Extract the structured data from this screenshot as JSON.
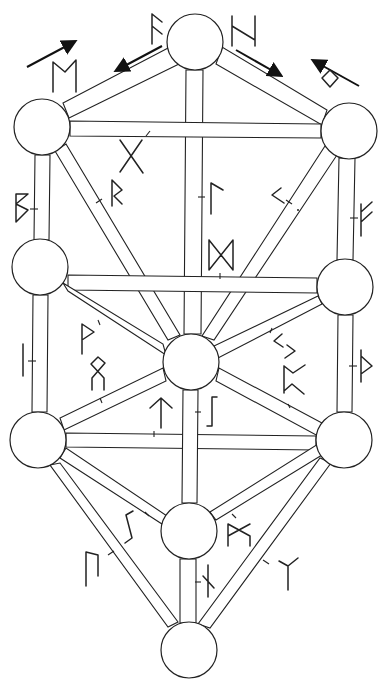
{
  "diagram": {
    "type": "tree-of-life-runes",
    "colors": {
      "stroke": "#222222",
      "background": "#ffffff",
      "node_fill": "#ffffff"
    },
    "nodes": [
      {
        "id": "top",
        "x": 195,
        "y": 42,
        "r": 28
      },
      {
        "id": "upper-left",
        "x": 42,
        "y": 127,
        "r": 28
      },
      {
        "id": "upper-right",
        "x": 349,
        "y": 131,
        "r": 28
      },
      {
        "id": "mid-left",
        "x": 40,
        "y": 267,
        "r": 28
      },
      {
        "id": "mid-right",
        "x": 345,
        "y": 287,
        "r": 28
      },
      {
        "id": "center",
        "x": 191,
        "y": 362,
        "r": 28
      },
      {
        "id": "lower-left",
        "x": 38,
        "y": 440,
        "r": 28
      },
      {
        "id": "lower-right",
        "x": 344,
        "y": 440,
        "r": 28
      },
      {
        "id": "lower-center",
        "x": 189,
        "y": 531,
        "r": 28
      },
      {
        "id": "bottom",
        "x": 189,
        "y": 650,
        "r": 28
      }
    ],
    "runes": [
      {
        "name": "fehu",
        "glyph": "ᚠ"
      },
      {
        "name": "hagalaz",
        "glyph": "ᚺ"
      },
      {
        "name": "mannaz",
        "glyph": "ᛗ"
      },
      {
        "name": "ingwaz",
        "glyph": "ᛜ"
      },
      {
        "name": "gebo",
        "glyph": "ᚷ"
      },
      {
        "name": "berkano",
        "glyph": "ᛒ"
      },
      {
        "name": "raido",
        "glyph": "ᚱ"
      },
      {
        "name": "laguz",
        "glyph": "ᛚ"
      },
      {
        "name": "kenaz",
        "glyph": "ᚲ"
      },
      {
        "name": "ansuz",
        "glyph": "ᚨ"
      },
      {
        "name": "dagaz",
        "glyph": "ᛞ"
      },
      {
        "name": "isa",
        "glyph": "ᛁ"
      },
      {
        "name": "wunjo",
        "glyph": "ᚹ"
      },
      {
        "name": "othala",
        "glyph": "ᛟ"
      },
      {
        "name": "jera",
        "glyph": "ᛃ"
      },
      {
        "name": "perthro",
        "glyph": "ᛈ"
      },
      {
        "name": "thurisaz",
        "glyph": "ᚦ"
      },
      {
        "name": "tiwaz",
        "glyph": "ᛏ"
      },
      {
        "name": "eihwaz",
        "glyph": "ᛇ"
      },
      {
        "name": "sowilo",
        "glyph": "ᛊ"
      },
      {
        "name": "ehwaz",
        "glyph": "ᛖ"
      },
      {
        "name": "uruz",
        "glyph": "ᚢ"
      },
      {
        "name": "nauthiz",
        "glyph": "ᚾ"
      },
      {
        "name": "algiz",
        "glyph": "ᛉ"
      }
    ],
    "arrows": [
      {
        "id": "arrow-upper-left",
        "direction": "up-right"
      },
      {
        "id": "arrow-top-left",
        "direction": "down-left"
      },
      {
        "id": "arrow-top-right",
        "direction": "down-right"
      },
      {
        "id": "arrow-upper-right",
        "direction": "up-left"
      }
    ]
  }
}
